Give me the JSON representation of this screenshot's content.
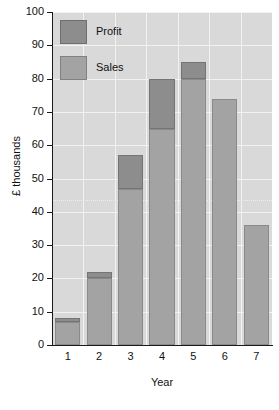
{
  "chart_data": {
    "type": "bar",
    "subtype": "stacked-column",
    "title": "",
    "xlabel": "Year",
    "ylabel": "£ thousands",
    "categories": [
      "1",
      "2",
      "3",
      "4",
      "5",
      "6",
      "7"
    ],
    "series": [
      {
        "name": "Sales",
        "color": "#a3a3a3",
        "values": [
          7,
          20,
          47,
          65,
          80,
          74,
          36
        ]
      },
      {
        "name": "Profit",
        "color": "#8d8d8d",
        "values": [
          1,
          2,
          10,
          15,
          5,
          0,
          0
        ]
      }
    ],
    "totals": [
      8,
      22,
      57,
      80,
      85,
      74,
      36
    ],
    "ylim": [
      0,
      100
    ],
    "ytick_step": 10,
    "ytick_labels": [
      "0",
      "10",
      "20",
      "30",
      "40",
      "50",
      "60",
      "70",
      "80",
      "90",
      "100"
    ],
    "grid": true,
    "reference_line": {
      "value": 43.5,
      "style": "dotted"
    },
    "legend": {
      "position": "top-left",
      "entries": [
        {
          "label": "Profit",
          "color": "#8d8d8d"
        },
        {
          "label": "Sales",
          "color": "#a3a3a3"
        }
      ]
    },
    "plot_background": "#d9d9d9",
    "gridline_color": "#f2f2f2",
    "axis_color": "#1a1a1a"
  }
}
